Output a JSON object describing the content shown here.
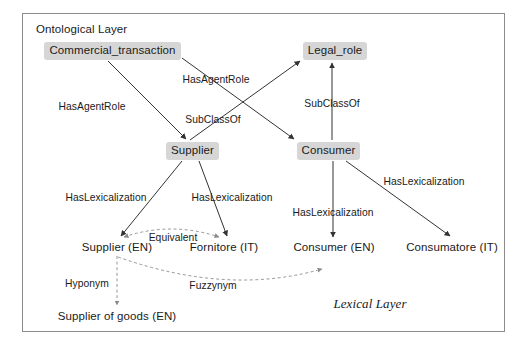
{
  "figure": {
    "ontological_layer_title": "Ontological Layer",
    "lexical_layer_title": "Lexical Layer",
    "frame_color": "#8c8c8c",
    "node_fill": "#d6d6d6",
    "line_color": "#333333",
    "dashed_line_color": "#8a8a8a"
  },
  "ontology_nodes": [
    {
      "id": "commercial_transaction",
      "label": "Commercial_transaction",
      "x": 44,
      "y": 42,
      "w": 137,
      "h": 18
    },
    {
      "id": "legal_role",
      "label": "Legal_role",
      "x": 303,
      "y": 42,
      "w": 64,
      "h": 18
    },
    {
      "id": "supplier",
      "label": "Supplier",
      "x": 166,
      "y": 142,
      "w": 53,
      "h": 18
    },
    {
      "id": "consumer",
      "label": "Consumer",
      "x": 297,
      "y": 142,
      "w": 63,
      "h": 18
    }
  ],
  "lexical_nodes": [
    {
      "id": "supplier_en",
      "label": "Supplier (EN)",
      "cx": 117,
      "cy": 248
    },
    {
      "id": "fornitore_it",
      "label": "Fornitore (IT)",
      "cx": 224,
      "cy": 248
    },
    {
      "id": "consumer_en",
      "label": "Consumer (EN)",
      "cx": 334,
      "cy": 248
    },
    {
      "id": "consumatore_it",
      "label": "Consumatore (IT)",
      "cx": 452,
      "cy": 248
    },
    {
      "id": "supplier_of_goods_en",
      "label": "Supplier of goods (EN)",
      "cx": 117,
      "cy": 317
    }
  ],
  "edges": [
    {
      "id": "ct-to-supplier",
      "relation": "HasAgentRole",
      "from": "commercial_transaction",
      "to": "supplier",
      "style": "solid",
      "path": "M 108 61 L 186 139",
      "label_x": 92,
      "label_y": 107
    },
    {
      "id": "ct-to-consumer",
      "relation": "HasAgentRole",
      "from": "commercial_transaction",
      "to": "consumer",
      "style": "solid",
      "path": "M 182 58 L 294 139",
      "label_x": 216,
      "label_y": 80
    },
    {
      "id": "supplier-to-legal-role",
      "relation": "SubClassOf",
      "from": "supplier",
      "to": "legal_role",
      "style": "solid",
      "path": "M 190 140 L 300 61",
      "label_x": 213,
      "label_y": 120
    },
    {
      "id": "consumer-to-legal-role",
      "relation": "SubClassOf",
      "from": "consumer",
      "to": "legal_role",
      "style": "solid",
      "path": "M 332 140 L 332 63",
      "label_x": 332,
      "label_y": 104
    },
    {
      "id": "supplier-to-supplier-en",
      "relation": "HasLexicalization",
      "from": "supplier",
      "to": "supplier_en",
      "style": "solid",
      "path": "M 182 161 L 121 236",
      "label_x": 106,
      "label_y": 198
    },
    {
      "id": "supplier-to-fornitore-it",
      "relation": "HasLexicalization",
      "from": "supplier",
      "to": "fornitore_it",
      "style": "solid",
      "path": "M 199 161 L 227 236",
      "label_x": 232,
      "label_y": 198
    },
    {
      "id": "consumer-to-consumer-en",
      "relation": "HasLexicalization",
      "from": "consumer",
      "to": "consumer_en",
      "style": "solid",
      "path": "M 333 161 L 333 237",
      "label_x": 333,
      "label_y": 213
    },
    {
      "id": "consumer-to-consumatore-it",
      "relation": "HasLexicalization",
      "from": "consumer",
      "to": "consumatore_it",
      "style": "solid",
      "path": "M 346 161 L 450 236",
      "label_x": 424,
      "label_y": 182
    },
    {
      "id": "supplier-en-equivalent-fornitore-it",
      "relation": "Equivalent",
      "from": "supplier_en",
      "to": "fornitore_it",
      "style": "dashed",
      "bidirectional": true,
      "path": "M 124 237 Q 171 221 219 237",
      "label_x": 173,
      "label_y": 238
    },
    {
      "id": "supplier-en-fuzzynym-consumer-en",
      "relation": "Fuzzynym",
      "from": "supplier_en",
      "to": "consumer_en",
      "style": "dashed",
      "path": "M 118 257 Q 228 296 322 269",
      "label_x": 213,
      "label_y": 286
    },
    {
      "id": "supplier-en-hyponym-supplier-of-goods",
      "relation": "Hyponym",
      "from": "supplier_en",
      "to": "supplier_of_goods_en",
      "style": "dashed",
      "path": "M 117 256 L 117 305",
      "label_x": 87,
      "label_y": 284
    }
  ]
}
